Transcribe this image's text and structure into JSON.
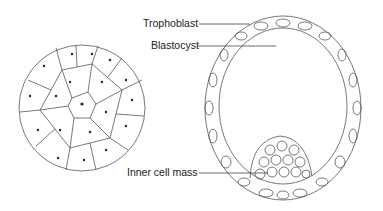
{
  "figure": {
    "left_panel": "Morula (solid ball of cells)",
    "right_panel": "Blastocyst cross-section"
  },
  "labels": {
    "trophoblast": "Trophoblast",
    "blastocyst": "Blastocyst",
    "inner_cell_mass": "Inner cell mass"
  },
  "colors": {
    "line": "#444444",
    "background": "#ffffff"
  }
}
